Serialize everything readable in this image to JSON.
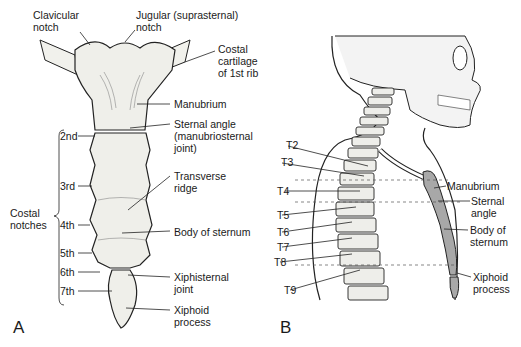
{
  "figure": {
    "panel_a": {
      "letter": "A",
      "labels": {
        "clavicular_notch": "Clavicular\nnotch",
        "jugular_notch": "Jugular (suprasternal)\nnotch",
        "costal_cartilage": "Costal\ncartilage\nof 1st rib",
        "manubrium": "Manubrium",
        "sternal_angle": "Sternal angle\n(manubriosternal\njoint)",
        "transverse_ridge": "Transverse\nridge",
        "body_of_sternum": "Body of sternum",
        "xiphisternal_joint": "Xiphisternal\njoint",
        "xiphoid_process": "Xiphoid\nprocess",
        "costal_notches": "Costal\nnotches"
      },
      "notches": [
        "2nd",
        "3rd",
        "4th",
        "5th",
        "6th",
        "7th"
      ]
    },
    "panel_b": {
      "letter": "B",
      "vertebrae": [
        "T2",
        "T3",
        "T4",
        "T5",
        "T6",
        "T7",
        "T8",
        "T9"
      ],
      "labels": {
        "manubrium": "Manubrium",
        "sternal_angle": "Sternal\nangle",
        "body_of_sternum": "Body of\nsternum",
        "xiphoid_process": "Xiphoid\nprocess"
      },
      "sternum_color": "#a8a8a8"
    }
  }
}
